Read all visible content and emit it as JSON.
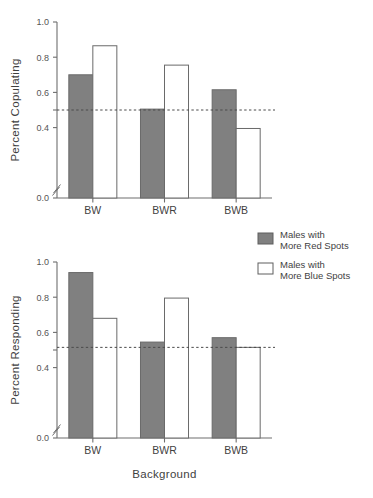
{
  "figure": {
    "background_color": "#ffffff",
    "bar_fill_color": "#808080",
    "bar_open_color": "#ffffff",
    "bar_edge_color": "#6a6a6a",
    "text_color": "#3f3f3f"
  },
  "legend": {
    "position": "right",
    "entries": [
      {
        "swatch": "filled-gray",
        "line1": "Males with",
        "line2": "More Red Spots"
      },
      {
        "swatch": "open-white",
        "line1": "Males with",
        "line2": "More Blue Spots"
      }
    ]
  },
  "chart_data": [
    {
      "id": "top-panel",
      "type": "bar",
      "title": "",
      "xlabel": "",
      "ylabel": "Percent  Copulating",
      "categories": [
        "BW",
        "BWR",
        "BWB"
      ],
      "ylim": [
        0.0,
        1.0
      ],
      "yticks": [
        0.0,
        0.4,
        0.5,
        0.6,
        0.8,
        1.0
      ],
      "ytick_labels": [
        "0.0",
        "0.4",
        "",
        "0.6",
        "0.8",
        "1.0"
      ],
      "axis_break": true,
      "grid": false,
      "reference_line": {
        "value": 0.5,
        "style": "dotted"
      },
      "series": [
        {
          "name": "Males with More Red Spots",
          "style": "filled-gray",
          "values": [
            0.7,
            0.505,
            0.615
          ]
        },
        {
          "name": "Males with More Blue Spots",
          "style": "open-white",
          "values": [
            0.865,
            0.755,
            0.395
          ]
        }
      ]
    },
    {
      "id": "bottom-panel",
      "type": "bar",
      "title": "",
      "xlabel": "Background",
      "ylabel": "Percent Responding",
      "categories": [
        "BW",
        "BWR",
        "BWB"
      ],
      "ylim": [
        0.0,
        1.0
      ],
      "yticks": [
        0.0,
        0.4,
        0.5,
        0.6,
        0.8,
        1.0
      ],
      "ytick_labels": [
        "0.0",
        "0.4",
        "",
        "0.6",
        "0.8",
        "1.0"
      ],
      "axis_break": true,
      "grid": false,
      "reference_line": {
        "value": 0.515,
        "style": "dotted"
      },
      "series": [
        {
          "name": "Males with More Red Spots",
          "style": "filled-gray",
          "values": [
            0.94,
            0.545,
            0.57
          ]
        },
        {
          "name": "Males with More Blue Spots",
          "style": "open-white",
          "values": [
            0.68,
            0.795,
            0.515
          ]
        }
      ]
    }
  ]
}
